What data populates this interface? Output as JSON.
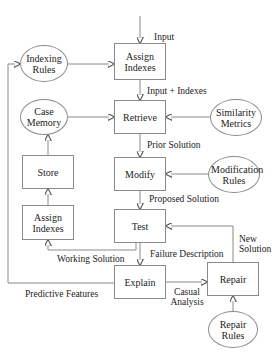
{
  "diagram": {
    "type": "case-based reasoning flowchart",
    "process_boxes": {
      "assign_indexes_top": "Assign Indexes",
      "retrieve": "Retrieve",
      "modify": "Modify",
      "test": "Test",
      "explain": "Explain",
      "repair": "Repair",
      "store": "Store",
      "assign_indexes_left": "Assign Indexes"
    },
    "knowledge_sources": {
      "indexing_rules": "Indexing Rules",
      "case_memory": "Case Memory",
      "similarity_metrics": "Similarity Metrics",
      "modification_rules": "Modification Rules",
      "repair_rules": "Repair Rules"
    },
    "edge_labels": {
      "input": "Input",
      "input_indexes": "Input + Indexes",
      "prior_solution": "Prior Solution",
      "proposed_solution": "Proposed Solution",
      "failure_description": "Failure Description",
      "working_solution": "Working Solution",
      "new_solution_1": "New",
      "new_solution_2": "Solution",
      "predictive_features": "Predictive Features",
      "casual_analysis_1": "Casual",
      "casual_analysis_2": "Analysis"
    },
    "colors": {
      "line": "#8a8a8a",
      "text": "#222222",
      "background": "#ffffff"
    }
  }
}
